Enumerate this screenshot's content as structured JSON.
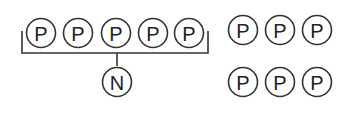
{
  "diagram": {
    "group_left": {
      "nodes": [
        "P",
        "P",
        "P",
        "P",
        "P"
      ],
      "joined_to": "N"
    },
    "grid_right": {
      "row1": [
        "P",
        "P",
        "P"
      ],
      "row2": [
        "P",
        "P",
        "P"
      ]
    },
    "colors": {
      "stroke": "#333333",
      "background": "#ffffff"
    }
  }
}
